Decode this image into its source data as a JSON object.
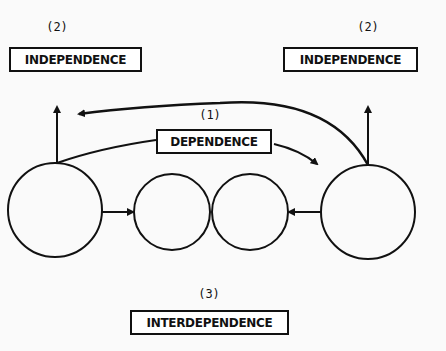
{
  "labels": {
    "independence_left": {
      "number": "(2)",
      "text": "INDEPENDENCE"
    },
    "independence_right": {
      "number": "(2)",
      "text": "INDEPENDENCE"
    },
    "dependence": {
      "number": "(1)",
      "text": "DEPENDENCE"
    },
    "interdependence": {
      "number": "(3)",
      "text": "INTERDEPENDENCE"
    }
  },
  "nodes": [
    {
      "id": "left-large",
      "cx": 55,
      "cy": 210,
      "r": 47
    },
    {
      "id": "middle-left",
      "cx": 172,
      "cy": 212,
      "r": 38
    },
    {
      "id": "middle-right",
      "cx": 250,
      "cy": 212,
      "r": 38
    },
    {
      "id": "right-large",
      "cx": 368,
      "cy": 212,
      "r": 47
    }
  ],
  "colors": {
    "stroke": "#111111",
    "background": "#fafafa"
  }
}
